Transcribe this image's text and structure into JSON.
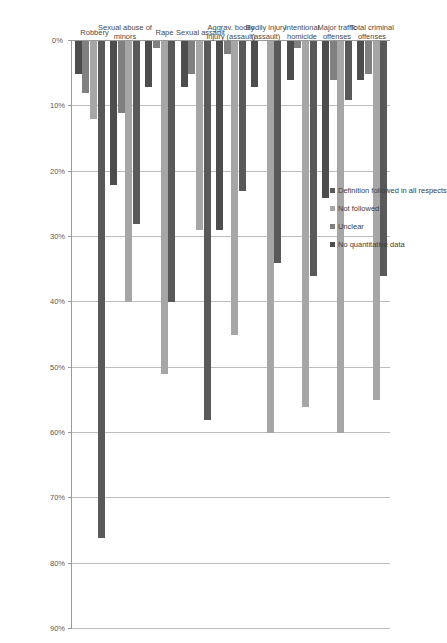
{
  "chart_data": {
    "type": "bar",
    "orientation": "horizontal",
    "title": "",
    "xlabel": "",
    "ylabel": "",
    "xlim": [
      0,
      90
    ],
    "grid": true,
    "legend_position": "inside-upper-left",
    "xtick_labels": [
      "0%",
      "10%",
      "20%",
      "30%",
      "40%",
      "50%",
      "60%",
      "70%",
      "80%",
      "90%"
    ],
    "xticks": [
      0,
      10,
      20,
      30,
      40,
      50,
      60,
      70,
      80,
      90
    ],
    "categories": [
      "Total criminal\noffenses",
      "Major traffic\noffenses",
      "Intentional\nhomicide",
      "Bodily injury\n(assault)",
      "Aggrav. bodily\ninjury (assault)",
      "Sexual assault",
      "Rape",
      "Sexual abuse of\nminors",
      "Robbery"
    ],
    "series": [
      {
        "name": "Definition followed in all respects",
        "color": "#595959",
        "values": [
          36,
          9,
          36,
          34,
          23,
          58,
          40,
          28,
          76
        ]
      },
      {
        "name": "Not followed",
        "color": "#a6a6a6",
        "values": [
          55,
          60,
          56,
          60,
          45,
          29,
          51,
          40,
          12
        ]
      },
      {
        "name": "Unclear",
        "color": "#808080",
        "values": [
          5,
          6,
          1,
          0,
          2,
          5,
          1,
          11,
          8
        ]
      },
      {
        "name": "No quantitative data",
        "color": "#4d4d4d",
        "values": [
          6,
          24,
          6,
          7,
          29,
          7,
          7,
          22,
          5
        ]
      }
    ]
  },
  "legend": {
    "items": [
      {
        "label": "Definition followed in all respects",
        "color": "#595959"
      },
      {
        "label": "Not followed",
        "color": "#a6a6a6"
      },
      {
        "label": "Unclear",
        "color": "#808080"
      },
      {
        "label": "No quantitative data",
        "color": "#4d4d4d"
      }
    ]
  },
  "colors": {
    "grid": "#bdbdbd",
    "axis": "#9a9a9a",
    "text": "#4a4a4a",
    "background": "#ffffff"
  }
}
